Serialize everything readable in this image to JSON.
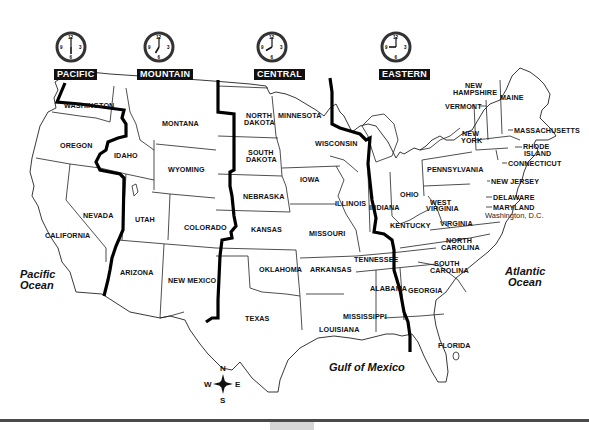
{
  "map": {
    "title": "U.S. Time Zones",
    "time_zones": [
      {
        "name": "PACIFIC",
        "clock_time": "6:00",
        "hour": 6,
        "minute": 0
      },
      {
        "name": "MOUNTAIN",
        "clock_time": "7:00",
        "hour": 7,
        "minute": 0
      },
      {
        "name": "CENTRAL",
        "clock_time": "8:00",
        "hour": 8,
        "minute": 0
      },
      {
        "name": "EASTERN",
        "clock_time": "9:00",
        "hour": 9,
        "minute": 0
      }
    ],
    "clock_numerals": [
      "12",
      "3",
      "6",
      "9"
    ],
    "states": {
      "washington": "WASHINGTON",
      "oregon": "OREGON",
      "california": "CALIFORNIA",
      "nevada": "NEVADA",
      "idaho": "IDAHO",
      "montana": "MONTANA",
      "wyoming": "WYOMING",
      "utah": "UTAH",
      "colorado": "COLORADO",
      "arizona": "ARIZONA",
      "new_mexico": "NEW MEXICO",
      "north_dakota_1": "NORTH",
      "north_dakota_2": "DAKOTA",
      "south_dakota_1": "SOUTH",
      "south_dakota_2": "DAKOTA",
      "nebraska": "NEBRASKA",
      "kansas": "KANSAS",
      "oklahoma": "OKLAHOMA",
      "texas": "TEXAS",
      "minnesota": "MINNESOTA",
      "iowa": "IOWA",
      "missouri": "MISSOURI",
      "arkansas": "ARKANSAS",
      "louisiana": "LOUISIANA",
      "wisconsin": "WISCONSIN",
      "illinois": "ILLINOIS",
      "mississippi": "MISSISSIPPI",
      "alabama": "ALABAMA",
      "tennessee": "TENNESSEE",
      "kentucky": "KENTUCKY",
      "indiana": "INDIANA",
      "ohio": "OHIO",
      "georgia": "GEORGIA",
      "florida": "FLORIDA",
      "south_carolina_1": "SOUTH",
      "south_carolina_2": "CAROLINA",
      "north_carolina_1": "NORTH",
      "north_carolina_2": "CAROLINA",
      "virginia": "VIRGINIA",
      "west_virginia_1": "WEST",
      "west_virginia_2": "VIRGINIA",
      "pennsylvania": "PENNSYLVANIA",
      "new_york_1": "NEW",
      "new_york_2": "YORK",
      "vermont": "VERMONT",
      "new_hampshire_1": "NEW",
      "new_hampshire_2": "HAMPSHIRE",
      "maine": "MAINE",
      "massachusetts": "MASSACHUSETTS",
      "rhode_island_1": "RHODE",
      "rhode_island_2": "ISLAND",
      "connecticut": "CONNECTICUT",
      "new_jersey": "NEW JERSEY",
      "delaware": "DELAWARE",
      "maryland": "MARYLAND",
      "washington_dc": "Washington, D.C."
    },
    "water": {
      "pacific_1": "Pacific",
      "pacific_2": "Ocean",
      "atlantic_1": "Atlantic",
      "atlantic_2": "Ocean",
      "gulf": "Gulf of Mexico"
    },
    "compass": {
      "n": "N",
      "e": "E",
      "s": "S",
      "w": "W"
    }
  },
  "colors": {
    "boundary": "#000000",
    "state_lines": "#222222",
    "label_bg": "#111111",
    "label_text": "#ffffff",
    "bottom_rule": "#4a4a4a",
    "bottom_tab": "#d6d6d6"
  }
}
